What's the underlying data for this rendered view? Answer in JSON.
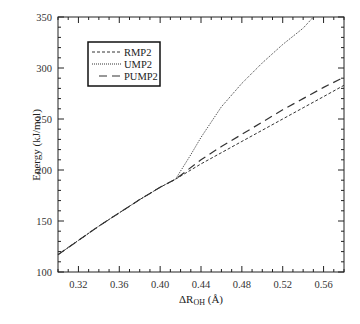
{
  "chart_data": {
    "type": "line",
    "title": "",
    "xlabel": "ΔR_OH (Å)",
    "ylabel": "Energy (kJ/mol)",
    "xlim": [
      0.3,
      0.58
    ],
    "ylim": [
      100,
      350
    ],
    "xticks": [
      0.32,
      0.36,
      0.4,
      0.44,
      0.48,
      0.52,
      0.56
    ],
    "yticks": [
      100,
      150,
      200,
      250,
      300,
      350
    ],
    "grid": false,
    "legend_position": "upper-left",
    "series": [
      {
        "name": "RMP2",
        "style": "short-dash",
        "x": [
          0.3,
          0.32,
          0.34,
          0.36,
          0.38,
          0.4,
          0.415,
          0.44,
          0.46,
          0.48,
          0.5,
          0.52,
          0.54,
          0.56,
          0.58
        ],
        "y": [
          117,
          131,
          145,
          158,
          171,
          183,
          191,
          206,
          217,
          228,
          239,
          250,
          261,
          272,
          283
        ]
      },
      {
        "name": "UMP2",
        "style": "dotted",
        "x": [
          0.3,
          0.32,
          0.34,
          0.36,
          0.38,
          0.4,
          0.415,
          0.43,
          0.44,
          0.46,
          0.48,
          0.5,
          0.52,
          0.54,
          0.55
        ],
        "y": [
          117,
          131,
          145,
          158,
          171,
          183,
          191,
          215,
          232,
          262,
          285,
          305,
          323,
          339,
          350
        ]
      },
      {
        "name": "PUMP2",
        "style": "long-dash",
        "x": [
          0.3,
          0.32,
          0.34,
          0.36,
          0.38,
          0.4,
          0.415,
          0.44,
          0.46,
          0.48,
          0.5,
          0.52,
          0.54,
          0.56,
          0.58
        ],
        "y": [
          117,
          131,
          145,
          158,
          171,
          183,
          191,
          210,
          223,
          235,
          247,
          259,
          270,
          281,
          291
        ]
      }
    ]
  },
  "labels": {
    "x_axis_main": "ΔR",
    "x_axis_sub": "OH",
    "x_axis_unit": " (Å)",
    "y_axis": "Energy (kJ/mol)",
    "legend": [
      "RMP2",
      "UMP2",
      "PUMP2"
    ]
  }
}
